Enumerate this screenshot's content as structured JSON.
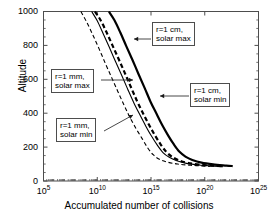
{
  "chart_data": {
    "type": "line",
    "title": "",
    "xlabel": "Accumulated number of collisions",
    "ylabel": "Altitude",
    "xscale": "log",
    "xlim": [
      100000.0,
      1e+25
    ],
    "ylim": [
      0,
      1000
    ],
    "xticks": [
      "10^5",
      "10^10",
      "10^15",
      "10^20",
      "10^25"
    ],
    "xtick_exponents": [
      "5",
      "10",
      "15",
      "20",
      "25"
    ],
    "xtick_base": "10",
    "yticks": [
      0,
      200,
      400,
      600,
      800,
      1000
    ],
    "grid": false,
    "legend_position": "inline-annotations",
    "series": [
      {
        "name": "r=1 mm, solar min",
        "style": "dashed-thin",
        "points": [
          [
            300000000.0,
            1000
          ],
          [
            1000000000.0,
            940
          ],
          [
            4000000000.0,
            860
          ],
          [
            16000000000.0,
            775
          ],
          [
            60000000000.0,
            690
          ],
          [
            220000000000.0,
            610
          ],
          [
            800000000000.0,
            530
          ],
          [
            3000000000000.0,
            450
          ],
          [
            10000000000000.0,
            380
          ],
          [
            40000000000000.0,
            310
          ],
          [
            150000000000000.0,
            250
          ],
          [
            500000000000000.0,
            195
          ],
          [
            1600000000000000.0,
            155
          ],
          [
            6000000000000000.0,
            128
          ],
          [
            3e+16,
            112
          ],
          [
            3e+17,
            100
          ],
          [
            5e+18,
            93
          ],
          [
            1e+20,
            88
          ],
          [
            3e+20,
            86
          ]
        ]
      },
      {
        "name": "r=1 mm, solar max",
        "style": "solid-thin",
        "points": [
          [
            3000000000.0,
            1000
          ],
          [
            10000000000.0,
            945
          ],
          [
            35000000000.0,
            870
          ],
          [
            130000000000.0,
            790
          ],
          [
            500000000000.0,
            705
          ],
          [
            2000000000000.0,
            620
          ],
          [
            7000000000000.0,
            540
          ],
          [
            25000000000000.0,
            462
          ],
          [
            90000000000000.0,
            392
          ],
          [
            320000000000000.0,
            325
          ],
          [
            1100000000000000.0,
            265
          ],
          [
            4000000000000000.0,
            210
          ],
          [
            1.3e+16,
            168
          ],
          [
            5e+16,
            140
          ],
          [
            2.5e+17,
            120
          ],
          [
            2e+18,
            104
          ],
          [
            3e+19,
            94
          ],
          [
            6e+20,
            88
          ],
          [
            5e+21,
            84
          ]
        ]
      },
      {
        "name": "r=1 cm, solar min",
        "style": "dashed-thick",
        "points": [
          [
            6000000000.0,
            1000
          ],
          [
            20000000000.0,
            950
          ],
          [
            70000000000.0,
            880
          ],
          [
            260000000000.0,
            800
          ],
          [
            1000000000000.0,
            718
          ],
          [
            3800000000000.0,
            635
          ],
          [
            14000000000000.0,
            552
          ],
          [
            50000000000000.0,
            472
          ],
          [
            180000000000000.0,
            400
          ],
          [
            650000000000000.0,
            332
          ],
          [
            2300000000000000.0,
            270
          ],
          [
            8000000000000000.0,
            215
          ],
          [
            2.6e+16,
            172
          ],
          [
            9e+16,
            143
          ],
          [
            4e+17,
            122
          ],
          [
            3e+18,
            106
          ],
          [
            4e+19,
            96
          ],
          [
            8e+20,
            90
          ],
          [
            6e+21,
            86
          ]
        ]
      },
      {
        "name": "r=1 cm, solar max",
        "style": "solid-thick",
        "points": [
          [
            120000000000.0,
            1000
          ],
          [
            400000000000.0,
            948
          ],
          [
            1400000000000.0,
            876
          ],
          [
            5000000000000.0,
            796
          ],
          [
            19000000000000.0,
            714
          ],
          [
            70000000000000.0,
            630
          ],
          [
            260000000000000.0,
            548
          ],
          [
            900000000000000.0,
            468
          ],
          [
            3200000000000000.0,
            398
          ],
          [
            1.1e+16,
            330
          ],
          [
            4e+16,
            268
          ],
          [
            1.4e+17,
            214
          ],
          [
            4.5e+17,
            172
          ],
          [
            1.6e+18,
            144
          ],
          [
            7e+18,
            124
          ],
          [
            5e+19,
            108
          ],
          [
            6e+20,
            98
          ],
          [
            1e+22,
            91
          ],
          [
            4e+22,
            88
          ]
        ]
      }
    ],
    "annotations": [
      {
        "id": "anno-r1cm-solar-max",
        "line1": "r=1 cm,",
        "line2": "solar max",
        "target_series": "r=1 cm, solar max",
        "arrow_direction": "left"
      },
      {
        "id": "anno-r1mm-solar-max",
        "line1": "r=1 mm,",
        "line2": "solar max",
        "target_series": "r=1 mm, solar max",
        "arrow_direction": "right"
      },
      {
        "id": "anno-r1cm-solar-min",
        "line1": "r=1 cm,",
        "line2": "solar min",
        "target_series": "r=1 cm, solar min",
        "arrow_direction": "left"
      },
      {
        "id": "anno-r1mm-solar-min",
        "line1": "r=1 mm,",
        "line2": "solar min",
        "target_series": "r=1 mm, solar min",
        "arrow_direction": "upper-right"
      }
    ],
    "colors": {
      "axis": "#4d4d4d",
      "curve": "#000000",
      "background": "#ffffff",
      "annotation_border": "#4d4d4d"
    }
  }
}
